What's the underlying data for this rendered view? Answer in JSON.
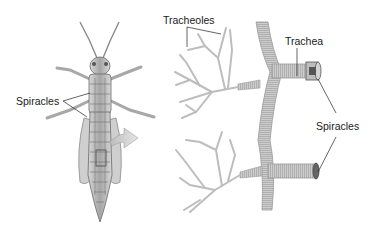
{
  "diagram": {
    "left_panel": {
      "subject": "grasshopper",
      "labels": {
        "spiracles": "Spiracles"
      }
    },
    "right_panel": {
      "subject": "tracheal-system",
      "labels": {
        "tracheoles": "Tracheoles",
        "trachea": "Trachea",
        "spiracles": "Spiracles"
      }
    },
    "colors": {
      "background": "#ffffff",
      "tube": "#c8c8c8",
      "tube_shade": "#9a9a9a",
      "body": "#b8b8b8",
      "body_dark": "#6a6a6a",
      "arrow": "#cfcfcf",
      "leader": "#222222",
      "text": "#1a1a1a"
    }
  }
}
